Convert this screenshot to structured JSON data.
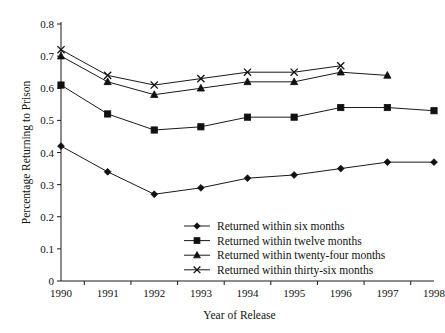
{
  "chart_data": {
    "type": "line",
    "title": "",
    "xlabel": "Year of Release",
    "ylabel": "Percentage Returning to Prison",
    "categories": [
      1990,
      1991,
      1992,
      1993,
      1994,
      1995,
      1996,
      1997,
      1998
    ],
    "xtick_labels": [
      "1990",
      "1991",
      "1992",
      "1993",
      "1994",
      "1995",
      "1996",
      "1997",
      "1998"
    ],
    "ytick_labels": [
      "0",
      "0.1",
      "0.2",
      "0.3",
      "0.4",
      "0.5",
      "0.6",
      "0.7",
      "0.8"
    ],
    "ytick_values": [
      0,
      0.1,
      0.2,
      0.3,
      0.4,
      0.5,
      0.6,
      0.7,
      0.8
    ],
    "ylim": [
      0,
      0.8
    ],
    "xlim": [
      1990,
      1998
    ],
    "grid": false,
    "legend_position": "inside-lower-right",
    "series": [
      {
        "name": "Returned within six months",
        "marker": "diamond",
        "color": "#111111",
        "x": [
          1990,
          1991,
          1992,
          1993,
          1994,
          1995,
          1996,
          1997,
          1998
        ],
        "values": [
          0.42,
          0.34,
          0.27,
          0.29,
          0.32,
          0.33,
          0.35,
          0.37,
          0.37
        ]
      },
      {
        "name": "Returned within twelve months",
        "marker": "square",
        "color": "#111111",
        "x": [
          1990,
          1991,
          1992,
          1993,
          1994,
          1995,
          1996,
          1997,
          1998
        ],
        "values": [
          0.61,
          0.52,
          0.47,
          0.48,
          0.51,
          0.51,
          0.54,
          0.54,
          0.53
        ]
      },
      {
        "name": "Returned within twenty-four months",
        "marker": "triangle",
        "color": "#111111",
        "x": [
          1990,
          1991,
          1992,
          1993,
          1994,
          1995,
          1996,
          1997
        ],
        "values": [
          0.7,
          0.62,
          0.58,
          0.6,
          0.62,
          0.62,
          0.65,
          0.64
        ]
      },
      {
        "name": "Returned within thirty-six months",
        "marker": "x",
        "color": "#111111",
        "x": [
          1990,
          1991,
          1992,
          1993,
          1994,
          1995,
          1996
        ],
        "values": [
          0.72,
          0.64,
          0.61,
          0.63,
          0.65,
          0.65,
          0.67
        ]
      }
    ]
  },
  "legend": {
    "entries": [
      "Returned within six months",
      "Returned within twelve months",
      "Returned within twenty-four months",
      "Returned within thirty-six months"
    ]
  },
  "axes": {
    "y_title": "Percentage Returning to Prison",
    "x_title": "Year of Release"
  }
}
